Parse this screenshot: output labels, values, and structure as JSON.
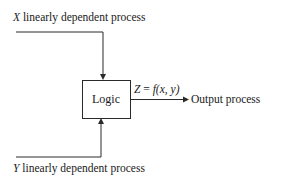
{
  "diagram": {
    "inputs": [
      {
        "var": "X",
        "label": "linearly dependent process"
      },
      {
        "var": "Y",
        "label": "linearly dependent process"
      }
    ],
    "block": {
      "label": "Logic"
    },
    "formula": {
      "lhs": "Z",
      "eq": " = ",
      "fn": "f",
      "args": "(x, y)"
    },
    "output": {
      "label": "Output process"
    },
    "colors": {
      "line": "#2a2a2a",
      "background": "#ffffff"
    }
  }
}
